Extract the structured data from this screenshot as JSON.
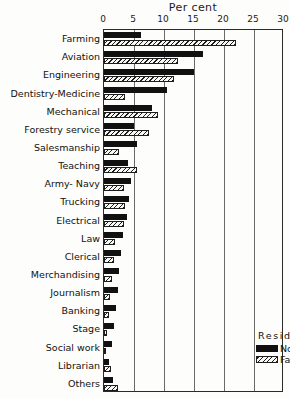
{
  "chart_data": {
    "type": "bar",
    "orientation": "horizontal",
    "title": "Per cent",
    "xlabel": "Per cent",
    "ylabel": "",
    "xlim": [
      0,
      30
    ],
    "xticks": [
      0,
      5,
      10,
      15,
      20,
      25,
      30
    ],
    "grid": true,
    "legend": {
      "title": "Residence",
      "position": "inside-bottom-right",
      "entries": [
        {
          "name": "Non-farm",
          "pattern": "solid-black"
        },
        {
          "name": "Farm",
          "pattern": "diagonal-hatch"
        }
      ]
    },
    "categories": [
      "Farming",
      "Aviation",
      "Engineering",
      "Dentistry-Medicine",
      "Mechanical",
      "Forestry service",
      "Salesmanship",
      "Teaching",
      "Army- Navy",
      "Trucking",
      "Electrical",
      "Law",
      "Clerical",
      "Merchandising",
      "Journalism",
      "Banking",
      "Stage",
      "Social work",
      "Librarian",
      "Others"
    ],
    "series": [
      {
        "name": "Non-farm",
        "values": [
          6.2,
          16.5,
          15.0,
          10.5,
          8.0,
          5.0,
          5.5,
          4.0,
          4.5,
          4.2,
          3.8,
          3.2,
          2.8,
          2.5,
          2.3,
          2.0,
          1.6,
          1.4,
          0.8,
          1.5
        ]
      },
      {
        "name": "Farm",
        "values": [
          22.0,
          12.3,
          11.7,
          3.5,
          9.0,
          7.5,
          2.5,
          5.5,
          3.3,
          3.5,
          3.3,
          1.8,
          1.7,
          1.3,
          1.0,
          0.8,
          0.5,
          0.4,
          1.2,
          2.3
        ]
      }
    ]
  }
}
